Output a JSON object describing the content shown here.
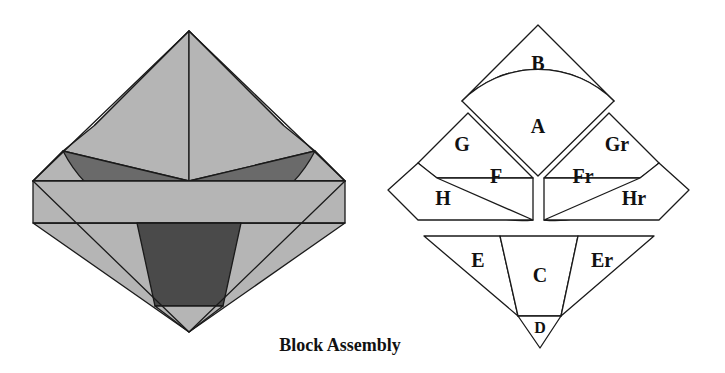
{
  "figure": {
    "caption": "Block Assembly",
    "colors": {
      "outline": "#1a1a1a",
      "background": "#ffffff",
      "shade_light": "#d6d6d6",
      "shade_medium": "#b5b5b5",
      "shade_dark": "#6a6a6a",
      "shade_darkest": "#4a4a4a",
      "unfilled": "#ffffff"
    },
    "assembled": {
      "name": "assembled-block-diamond",
      "description": "Assembled square block rotated 45 degrees, shaded by piece",
      "pieces": [
        {
          "id": "B",
          "shade": "#b5b5b5"
        },
        {
          "id": "A",
          "shade": "#d6d6d6"
        },
        {
          "id": "G",
          "shade": "#b5b5b5"
        },
        {
          "id": "Gr",
          "shade": "#b5b5b5"
        },
        {
          "id": "F",
          "shade": "#6a6a6a"
        },
        {
          "id": "Fr",
          "shade": "#6a6a6a"
        },
        {
          "id": "H",
          "shade": "#b5b5b5"
        },
        {
          "id": "Hr",
          "shade": "#b5b5b5"
        },
        {
          "id": "E",
          "shade": "#b5b5b5"
        },
        {
          "id": "Er",
          "shade": "#b5b5b5"
        },
        {
          "id": "C",
          "shade": "#4a4a4a"
        },
        {
          "id": "D",
          "shade": "#b5b5b5"
        }
      ]
    },
    "exploded": {
      "name": "exploded-block-diamond",
      "description": "Exploded line drawing of the same block, every piece labelled",
      "labels": {
        "A": "A",
        "B": "B",
        "C": "C",
        "D": "D",
        "E": "E",
        "Er": "Er",
        "F": "F",
        "Fr": "Fr",
        "G": "G",
        "Gr": "Gr",
        "H": "H",
        "Hr": "Hr"
      },
      "groups": [
        {
          "name": "top-group",
          "pieces": [
            "B",
            "A"
          ]
        },
        {
          "name": "middle-group",
          "pieces": [
            "G",
            "F",
            "H",
            "Gr",
            "Fr",
            "Hr"
          ]
        },
        {
          "name": "bottom-group",
          "pieces": [
            "E",
            "C",
            "Er",
            "D"
          ]
        }
      ]
    }
  }
}
